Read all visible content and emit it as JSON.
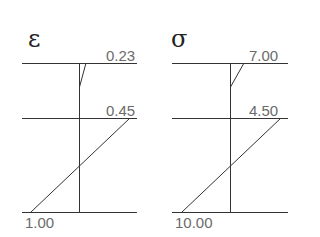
{
  "diagrams": [
    {
      "symbol": "ε",
      "name": "strain",
      "top_value": "0.23",
      "middle_value": "0.45",
      "bottom_value": "1.00"
    },
    {
      "symbol": "σ",
      "name": "stress",
      "top_value": "7.00",
      "middle_value": "4.50",
      "bottom_value": "10.00"
    }
  ],
  "colors": {
    "line": "#333333",
    "label": "#6b6b6b",
    "symbol": "#222222"
  }
}
